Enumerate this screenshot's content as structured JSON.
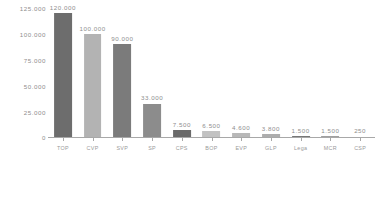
{
  "chart_data": {
    "type": "bar",
    "title": "",
    "subtitle": "",
    "xlabel": "",
    "ylabel": "",
    "categories": [
      "TOP",
      "CVP",
      "SVP",
      "SP",
      "CPS",
      "BOP",
      "EVP",
      "GLP",
      "Lega",
      "MCR",
      "CSP"
    ],
    "values": [
      120000,
      100000,
      90000,
      33000,
      7500,
      6500,
      4600,
      3800,
      1500,
      1500,
      250
    ],
    "value_labels": [
      "120.000",
      "100.000",
      "90.000",
      "33.000",
      "7.500",
      "6.500",
      "4.600",
      "3.800",
      "1.500",
      "1.500",
      "250"
    ],
    "bar_colors": [
      "#6d6d6d",
      "#b3b3b3",
      "#7b7b7b",
      "#8c8c8c",
      "#6a6a6a",
      "#c2c2c2",
      "#b8b8b8",
      "#adadad",
      "#777777",
      "#a0a0a0",
      "#bdbdbd"
    ],
    "ylim": [
      0,
      125000
    ],
    "y_ticks": [
      0,
      25000,
      50000,
      75000,
      100000,
      125000
    ],
    "y_tick_labels": [
      "0",
      "25.000",
      "50.000",
      "75.000",
      "100.000",
      "125.000"
    ],
    "grid": false,
    "legend": false,
    "axis_color": "#a8a8a8",
    "text_color": "#8e8e8e",
    "background": "#ffffff"
  }
}
